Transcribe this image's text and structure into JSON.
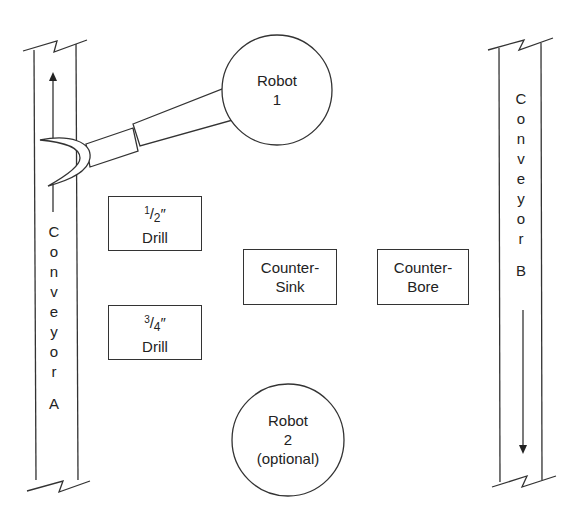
{
  "diagram": {
    "type": "workcell-layout",
    "conveyor_a": {
      "label_letters": [
        "C",
        "o",
        "n",
        "v",
        "e",
        "y",
        "o",
        "r"
      ],
      "id": "A",
      "direction": "up"
    },
    "conveyor_b": {
      "label_letters": [
        "C",
        "o",
        "n",
        "v",
        "e",
        "y",
        "o",
        "r"
      ],
      "id": "B",
      "direction": "down"
    },
    "robot1": {
      "line1": "Robot",
      "line2": "1"
    },
    "robot2": {
      "line1": "Robot",
      "line2": "2",
      "line3": "(optional)"
    },
    "stations": {
      "drill_half": {
        "num": "1",
        "den": "2",
        "unit": "″",
        "label": "Drill"
      },
      "drill_three_quarter": {
        "num": "3",
        "den": "4",
        "unit": "″",
        "label": "Drill"
      },
      "countersink": {
        "line1": "Counter-",
        "line2": "Sink"
      },
      "counterbore": {
        "line1": "Counter-",
        "line2": "Bore"
      }
    },
    "colors": {
      "stroke": "#333333",
      "background": "#ffffff",
      "text": "#222222"
    }
  }
}
